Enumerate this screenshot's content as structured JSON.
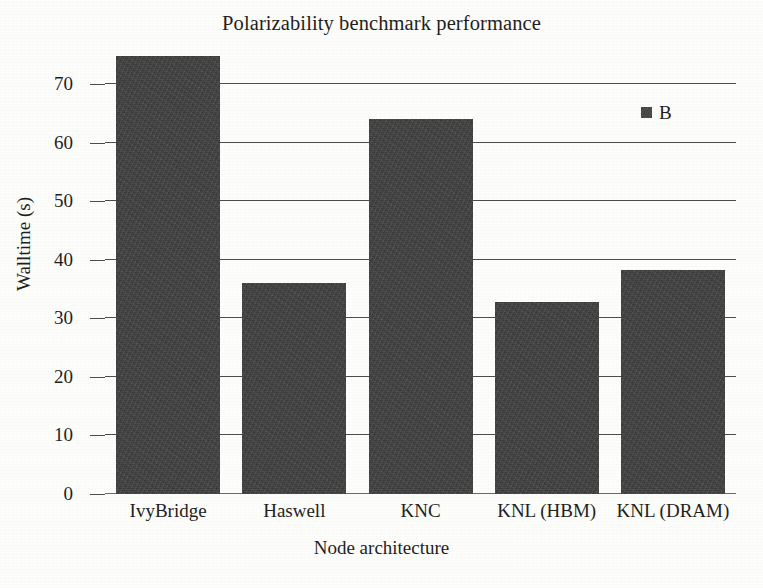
{
  "chart_data": {
    "type": "bar",
    "title": "Polarizability benchmark performance",
    "xlabel": "Node architecture",
    "ylabel": "Walltime (s)",
    "categories": [
      "IvyBridge",
      "Haswell",
      "KNC",
      "KNL (HBM)",
      "KNL (DRAM)"
    ],
    "values": [
      74.8,
      36.0,
      64.0,
      32.8,
      38.2
    ],
    "series": [
      {
        "name": "B",
        "values": [
          74.8,
          36.0,
          64.0,
          32.8,
          38.2
        ]
      }
    ],
    "ylim": [
      0,
      77.5
    ],
    "yticks": [
      0,
      10,
      20,
      30,
      40,
      50,
      60,
      70
    ],
    "ytick_labels": [
      "0",
      "10",
      "20",
      "30",
      "40",
      "50",
      "60",
      "70"
    ],
    "grid": "horizontal",
    "legend_position": "upper right",
    "legend_entries": [
      "B"
    ],
    "colors": {
      "bar_fill": "#414141",
      "gridline": "#4d4d4d",
      "axis": "#6a6a6a",
      "text": "#1f1f1f",
      "background": "#fdfdfb"
    }
  }
}
